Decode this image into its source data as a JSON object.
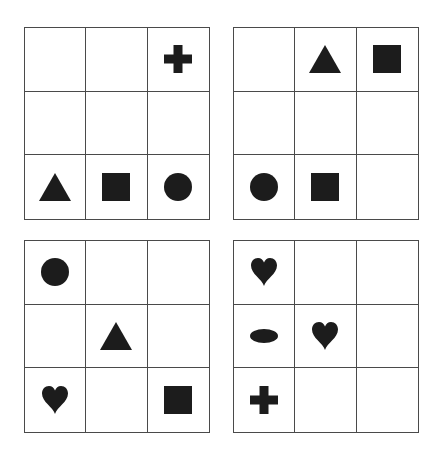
{
  "shape_color": "#1c1c1c",
  "grid_line_color": "#4a4a4a",
  "panels": [
    {
      "label": "panel-top-left",
      "cells": [
        [
          "",
          "",
          "cross"
        ],
        [
          "",
          "",
          ""
        ],
        [
          "triangle",
          "square",
          "circle"
        ]
      ]
    },
    {
      "label": "panel-top-right",
      "cells": [
        [
          "",
          "triangle",
          "square"
        ],
        [
          "",
          "",
          ""
        ],
        [
          "circle",
          "square",
          ""
        ]
      ]
    },
    {
      "label": "panel-bottom-left",
      "cells": [
        [
          "circle",
          "",
          ""
        ],
        [
          "",
          "triangle",
          ""
        ],
        [
          "heart",
          "",
          "square"
        ]
      ]
    },
    {
      "label": "panel-bottom-right",
      "cells": [
        [
          "heart",
          "",
          ""
        ],
        [
          "ellipse",
          "heart",
          ""
        ],
        [
          "cross",
          "",
          ""
        ]
      ]
    }
  ]
}
